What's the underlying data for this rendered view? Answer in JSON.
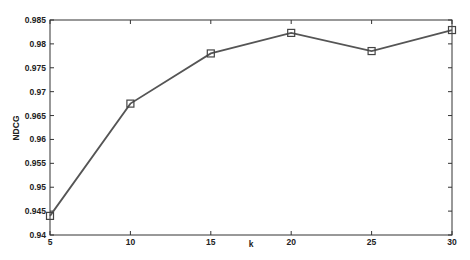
{
  "chart_data": {
    "type": "line",
    "title": "",
    "xlabel": "k",
    "ylabel": "NDCG",
    "x": [
      5,
      10,
      15,
      20,
      25,
      30
    ],
    "series": [
      {
        "name": "NDCG",
        "values": [
          0.944,
          0.9675,
          0.978,
          0.9823,
          0.9785,
          0.9829
        ],
        "marker": "open-square",
        "color": "#555555"
      }
    ],
    "xlim": [
      5,
      30
    ],
    "ylim": [
      0.94,
      0.985
    ],
    "xticks": [
      "5",
      "10",
      "15",
      "20",
      "25",
      "30"
    ],
    "yticks": [
      "0.94",
      "0.945",
      "0.95",
      "0.955",
      "0.96",
      "0.965",
      "0.97",
      "0.975",
      "0.98",
      "0.985"
    ],
    "grid": false,
    "legend": null
  }
}
